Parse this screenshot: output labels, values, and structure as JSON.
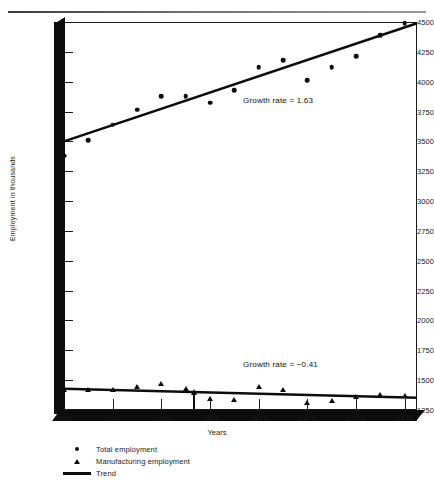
{
  "chart_data": {
    "type": "scatter",
    "title": "",
    "xlabel": "Years",
    "ylabel": "Employment in thousands",
    "xlim": [
      1965,
      1979.5
    ],
    "ylim": [
      1250,
      4500
    ],
    "xticks": [
      "1965",
      "1967",
      "1969",
      "1971",
      "1973",
      "1975",
      "1977",
      "1979"
    ],
    "xtick_values": [
      1965,
      1967,
      1969,
      1971,
      1973,
      1975,
      1977,
      1979
    ],
    "yticks": [
      "4500",
      "4250",
      "4000",
      "3750",
      "3500",
      "3250",
      "3000",
      "2750",
      "2500",
      "2250",
      "2000",
      "1750",
      "1500",
      "1250"
    ],
    "ytick_values": [
      4500,
      4250,
      4000,
      3750,
      3500,
      3250,
      3000,
      2750,
      2500,
      2250,
      2000,
      1750,
      1500,
      1250
    ],
    "grid": false,
    "legend_position": "bottom-left",
    "x": [
      1965,
      1966,
      1967,
      1968,
      1969,
      1970,
      1971,
      1972,
      1973,
      1974,
      1975,
      1976,
      1977,
      1978,
      1979
    ],
    "series": [
      {
        "name": "Total employment",
        "marker": "circle",
        "values": [
          3380,
          3510,
          3640,
          3765,
          3880,
          3880,
          3825,
          3930,
          4120,
          4180,
          4010,
          4120,
          4215,
          4390,
          4490
        ]
      },
      {
        "name": "Manufacturing employment",
        "marker": "triangle",
        "values": [
          1420,
          1415,
          1420,
          1440,
          1465,
          1425,
          1345,
          1330,
          1440,
          1420,
          1310,
          1325,
          1360,
          1375,
          1370
        ]
      },
      {
        "name": "Trend",
        "marker": "line",
        "lines": [
          {
            "label": "total-trend",
            "x0": 1965,
            "y0": 3500,
            "x1": 1979.5,
            "y1": 4490
          },
          {
            "label": "manufacturing-trend",
            "x0": 1965,
            "y0": 1428,
            "x1": 1979.5,
            "y1": 1352
          }
        ]
      }
    ],
    "annotations": [
      {
        "name": "growth-rate-total",
        "text": "Growth rate  =  1.63",
        "value": 1.63
      },
      {
        "name": "growth-rate-manufacturing",
        "text": "Growth rate  =  −0.41",
        "value": -0.41
      }
    ]
  },
  "legend": {
    "items": [
      {
        "label": "Total employment",
        "symbol": "circle-marker"
      },
      {
        "label": "Manufacturing employment",
        "symbol": "triangle-marker"
      },
      {
        "label": "Trend",
        "symbol": "line-marker"
      }
    ]
  }
}
